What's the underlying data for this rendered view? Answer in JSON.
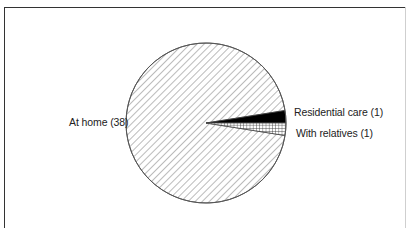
{
  "chart_data": {
    "type": "pie",
    "title": "",
    "categories": [
      "At home",
      "Residential care",
      "With relatives"
    ],
    "values": [
      38,
      1,
      1
    ],
    "labels": [
      "At home (38)",
      "Residential care (1)",
      "With relatives (1)"
    ],
    "fills": [
      "diagonal-hatch",
      "solid-black",
      "grid-hatch"
    ],
    "total": 40,
    "legend": "none (direct labels)"
  },
  "labels": {
    "at_home": "At home (38)",
    "residential": "Residential care (1)",
    "relatives": "With relatives (1)"
  }
}
